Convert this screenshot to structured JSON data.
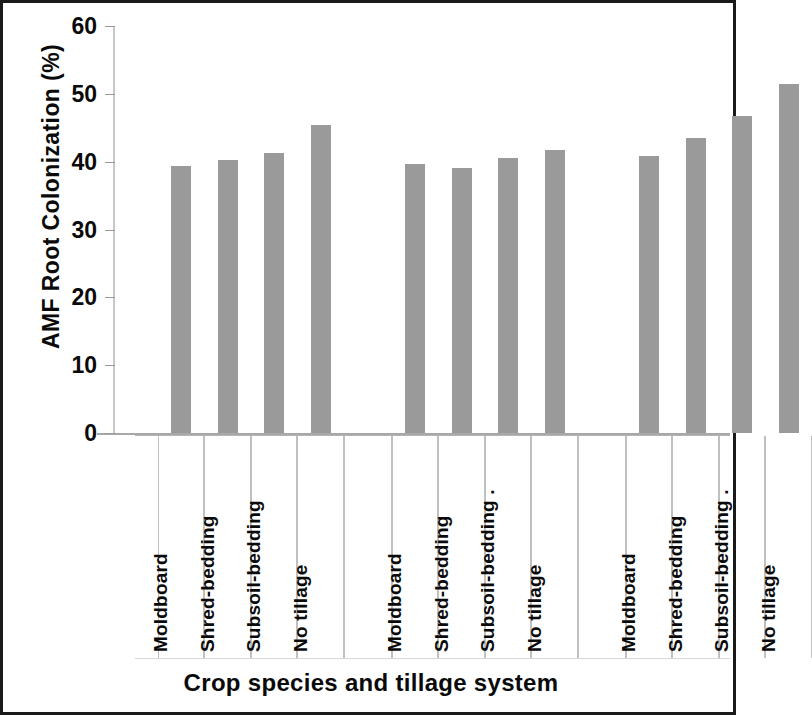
{
  "chart_data": {
    "type": "bar",
    "title": "",
    "xlabel": "Crop species and tillage system",
    "ylabel": "AMF Root  Colonization (%)",
    "ylim": [
      0,
      60
    ],
    "ytick_values": [
      60,
      50,
      40,
      30,
      20,
      10,
      0
    ],
    "ytick_labels": [
      "60",
      "50",
      "40",
      "30",
      "20",
      "10",
      "0"
    ],
    "grid": false,
    "legend": "none",
    "bar_color": "#9a9a9a",
    "categories": [
      "Moldboard",
      "Shred-bedding",
      "Subsoil-bedding",
      "No tillage",
      "Moldboard",
      "Shred-bedding",
      "Subsoil-bedding .",
      "No tillage",
      "Moldboard",
      "Shred-bedding",
      "Subsoil-bedding .",
      "No tillage"
    ],
    "values": [
      39.3,
      40.3,
      41.3,
      45.4,
      39.6,
      39.1,
      40.5,
      41.7,
      40.9,
      43.5,
      46.8,
      51.5
    ],
    "groups": [
      {
        "name": "Crop species 1",
        "categories": [
          "Moldboard",
          "Shred-bedding",
          "Subsoil-bedding",
          "No tillage"
        ],
        "values": [
          39.3,
          40.3,
          41.3,
          45.4
        ]
      },
      {
        "name": "Crop species 2",
        "categories": [
          "Moldboard",
          "Shred-bedding",
          "Subsoil-bedding .",
          "No tillage"
        ],
        "values": [
          39.6,
          39.1,
          40.5,
          41.7
        ]
      },
      {
        "name": "Crop species 3",
        "categories": [
          "Moldboard",
          "Shred-bedding",
          "Subsoil-bedding .",
          "No tillage"
        ],
        "values": [
          40.9,
          43.5,
          46.8,
          51.5
        ]
      }
    ]
  },
  "axes": {
    "y_title": "AMF Root  Colonization (%)",
    "x_title": "Crop species and tillage system"
  }
}
